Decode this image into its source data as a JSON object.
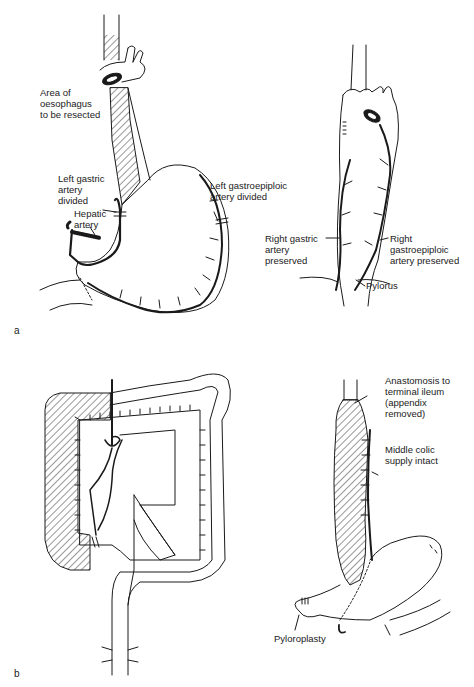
{
  "figure": {
    "panels": [
      {
        "letter": "a",
        "left_drawing": {
          "subject": "stomach-before-mobilisation",
          "labels": {
            "resect_area": "Area of\noesophagus\nto be resected",
            "left_gastric": "Left gastric\nartery\ndivided",
            "hepatic": "Hepatic\nartery",
            "left_gastroepiploic": "Left gastroepiploic\nartery divided"
          }
        },
        "right_drawing": {
          "subject": "stomach-tube-mobilised",
          "labels": {
            "right_gastric": "Right gastric\nartery\npreserved",
            "right_gastroepiploic": "Right\ngastroepiploic\nartery preserved",
            "pylorus": "Pylorus"
          }
        }
      },
      {
        "letter": "b",
        "left_drawing": {
          "subject": "colon-with-right-colon-hatched"
        },
        "right_drawing": {
          "subject": "colon-interposition",
          "labels": {
            "anastomosis": "Anastomosis to\nterminal ileum\n(appendix\nremoved)",
            "middle_colic": "Middle colic\nsupply intact",
            "pyloroplasty": "Pyloroplasty"
          }
        }
      }
    ],
    "colors": {
      "ink": "#1a1a1a",
      "background": "#ffffff"
    }
  }
}
